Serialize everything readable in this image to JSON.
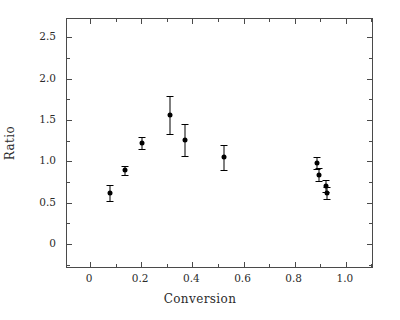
{
  "chart_data": {
    "type": "scatter",
    "title": "",
    "xlabel": "Conversion",
    "ylabel": "Ratio",
    "xlim": [
      -0.09,
      1.11
    ],
    "ylim": [
      -0.3,
      2.72
    ],
    "xticks": [
      "0",
      "0.2",
      "0.4",
      "0.6",
      "0.8",
      "1.0"
    ],
    "xtick_values": [
      0,
      0.2,
      0.4,
      0.6,
      0.8,
      1.0
    ],
    "yticks": [
      "0",
      "0.5",
      "1.0",
      "1.5",
      "2.0",
      "2.5"
    ],
    "ytick_values": [
      0,
      0.5,
      1.0,
      1.5,
      2.0,
      2.5
    ],
    "grid": false,
    "legend": null,
    "marker_style": "filled-circle",
    "error_bars": "vertical-symmetric-with-caps",
    "series": [
      {
        "name": "Ratio vs Conversion",
        "color": "#000000",
        "x": [
          0.075,
          0.135,
          0.2,
          0.31,
          0.368,
          0.523,
          0.885,
          0.893,
          0.92,
          0.925
        ],
        "y": [
          0.62,
          0.89,
          1.22,
          1.56,
          1.26,
          1.05,
          0.98,
          0.84,
          0.7,
          0.62
        ],
        "yerr": [
          0.1,
          0.05,
          0.07,
          0.23,
          0.19,
          0.15,
          0.07,
          0.08,
          0.07,
          0.07
        ]
      }
    ]
  },
  "axes": {
    "frame_color": "#4a4a4a",
    "tick_direction": "in",
    "minor_ticks": true
  }
}
